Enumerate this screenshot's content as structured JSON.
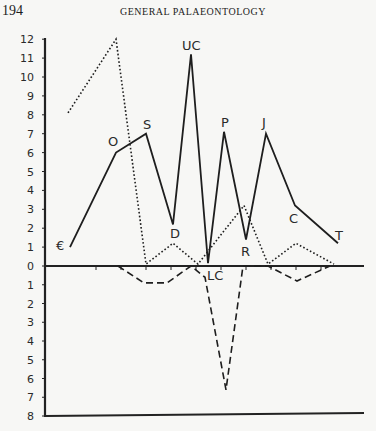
{
  "header": {
    "page_number": "194",
    "running_head": "GENERAL PALAEONTOLOGY"
  },
  "chart_data": {
    "type": "line",
    "title": "",
    "xlabel": "",
    "ylabel": "",
    "y_ticks_above": [
      "12",
      "11",
      "10",
      "9",
      "8",
      "7",
      "6",
      "5",
      "4",
      "3",
      "2",
      "1",
      "0"
    ],
    "y_ticks_below": [
      "1",
      "2",
      "3",
      "4",
      "5",
      "6",
      "7",
      "8"
    ],
    "ylim": [
      -8,
      12
    ],
    "grid": false,
    "legend": null,
    "categories": [
      "€",
      "O",
      "S",
      "D",
      "UC",
      "LC",
      "P",
      "R",
      "J",
      "C",
      "T"
    ],
    "series": [
      {
        "name": "solid",
        "style": "solid",
        "points": [
          {
            "label": "€",
            "x": 70,
            "y": 1.0
          },
          {
            "label": "O",
            "x": 116,
            "y": 6.0
          },
          {
            "label": "S",
            "x": 146,
            "y": 7.0
          },
          {
            "label": "D",
            "x": 173,
            "y": 2.2
          },
          {
            "label": "UC",
            "x": 191,
            "y": 11.2
          },
          {
            "label": "LC",
            "x": 208,
            "y": 0.15
          },
          {
            "label": "P",
            "x": 224,
            "y": 7.1
          },
          {
            "label": "R",
            "x": 246,
            "y": 1.4
          },
          {
            "label": "J",
            "x": 266,
            "y": 7.0
          },
          {
            "label": "C",
            "x": 295,
            "y": 3.2
          },
          {
            "label": "T",
            "x": 338,
            "y": 1.2
          }
        ]
      },
      {
        "name": "dotted",
        "style": "dotted",
        "points": [
          {
            "x": 68,
            "y": 8.1
          },
          {
            "x": 116,
            "y": 12.0
          },
          {
            "x": 146,
            "y": 0.1
          },
          {
            "x": 173,
            "y": 1.2
          },
          {
            "x": 198,
            "y": 0.1
          },
          {
            "x": 244,
            "y": 3.2
          },
          {
            "x": 268,
            "y": 0.1
          },
          {
            "x": 296,
            "y": 1.2
          },
          {
            "x": 334,
            "y": 0.1
          }
        ]
      },
      {
        "name": "dashed",
        "style": "dashed",
        "points": [
          {
            "x": 118,
            "y": 0
          },
          {
            "x": 144,
            "y": -0.9
          },
          {
            "x": 167,
            "y": -0.9
          },
          {
            "x": 191,
            "y": 0
          },
          {
            "x": 205,
            "y": -0.6
          },
          {
            "x": 226,
            "y": -6.6
          },
          {
            "x": 243,
            "y": 0
          },
          {
            "x": 268,
            "y": 0
          },
          {
            "x": 297,
            "y": -0.8
          },
          {
            "x": 330,
            "y": 0
          }
        ]
      }
    ],
    "point_labels": [
      {
        "text": "€",
        "px": 56,
        "py": 250
      },
      {
        "text": "O",
        "px": 108,
        "py": 146
      },
      {
        "text": "S",
        "px": 143,
        "py": 129
      },
      {
        "text": "D",
        "px": 170,
        "py": 238
      },
      {
        "text": "UC",
        "px": 182,
        "py": 50
      },
      {
        "text": "LC",
        "px": 207,
        "py": 280
      },
      {
        "text": "P",
        "px": 221,
        "py": 127
      },
      {
        "text": "R",
        "px": 241,
        "py": 256
      },
      {
        "text": "J",
        "px": 262,
        "py": 127
      },
      {
        "text": "C",
        "px": 289,
        "py": 223
      },
      {
        "text": "T",
        "px": 335,
        "py": 240
      }
    ]
  }
}
